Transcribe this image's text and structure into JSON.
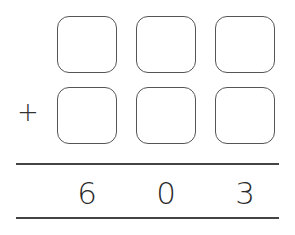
{
  "problem": {
    "operator": "+",
    "addend1_boxes": [
      "",
      "",
      ""
    ],
    "addend2_boxes": [
      "",
      "",
      ""
    ],
    "result_digits": [
      "6",
      "0",
      "3"
    ]
  }
}
